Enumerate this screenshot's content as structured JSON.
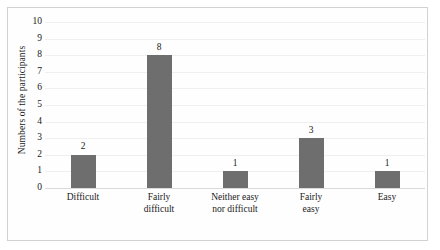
{
  "chart_data": {
    "type": "bar",
    "title": "",
    "xlabel": "",
    "ylabel": "Numbers of the participants",
    "categories": [
      "Difficult",
      "Fairly difficult",
      "Neither easy nor difficult",
      "Fairly easy",
      "Easy"
    ],
    "category_lines": [
      [
        "Difficult"
      ],
      [
        "Fairly",
        "difficult"
      ],
      [
        "Neither easy",
        "nor difficult"
      ],
      [
        "Fairly",
        "easy"
      ],
      [
        "Easy"
      ]
    ],
    "values": [
      2,
      8,
      1,
      3,
      1
    ],
    "ylim": [
      0,
      10
    ],
    "ytick_step": 1,
    "yticks": [
      10,
      9,
      8,
      7,
      6,
      5,
      4,
      3,
      2,
      1,
      0
    ],
    "grid": true,
    "grid_axis": "y",
    "legend": "none",
    "data_labels": [
      "2",
      "8",
      "1",
      "3",
      "1"
    ],
    "bar_color": "#6e6e6e",
    "gridline_color": "#efefef",
    "axis_color": "#d9d9d9",
    "frame_color": "#d2d2d2",
    "background_color": "#ffffff"
  }
}
